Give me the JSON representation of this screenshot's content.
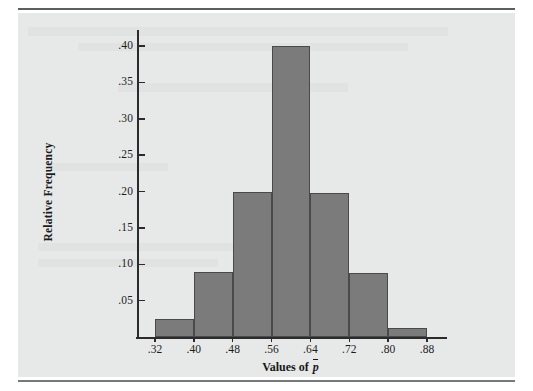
{
  "figure": {
    "background_color": "#ffffff",
    "panel_color": "#e7e9e9",
    "rule_color": "#5c5f61"
  },
  "chart_data": {
    "type": "bar",
    "title": "",
    "subtitle": "",
    "xlabel": "Values of p̄",
    "xlabel_plain": "Values of",
    "xlabel_symbol": "p",
    "ylabel": "Relative Frequency",
    "categories": [
      "0.32–0.40",
      "0.40–0.48",
      "0.48–0.56",
      "0.56–0.64",
      "0.64–0.72",
      "0.72–0.80",
      "0.80–0.88"
    ],
    "bin_edges": [
      0.32,
      0.4,
      0.48,
      0.56,
      0.64,
      0.72,
      0.8,
      0.88
    ],
    "values": [
      0.025,
      0.09,
      0.2,
      0.4,
      0.198,
      0.088,
      0.012
    ],
    "bar_color": "#7b7b7b",
    "bar_edge_color": "#4a4a4a",
    "xlim": [
      0.32,
      0.88
    ],
    "ylim": [
      0.0,
      0.425
    ],
    "grid": false,
    "legend": null,
    "x_ticks": [
      0.32,
      0.4,
      0.48,
      0.56,
      0.64,
      0.72,
      0.8,
      0.88
    ],
    "x_tick_labels": [
      ".32",
      ".40",
      ".48",
      ".56",
      ".64",
      ".72",
      ".80",
      ".88"
    ],
    "y_ticks": [
      0.05,
      0.1,
      0.15,
      0.2,
      0.25,
      0.3,
      0.35,
      0.4
    ],
    "y_tick_labels": [
      ".05",
      ".10",
      ".15",
      ".20",
      ".25",
      ".30",
      ".35",
      ".40"
    ]
  }
}
